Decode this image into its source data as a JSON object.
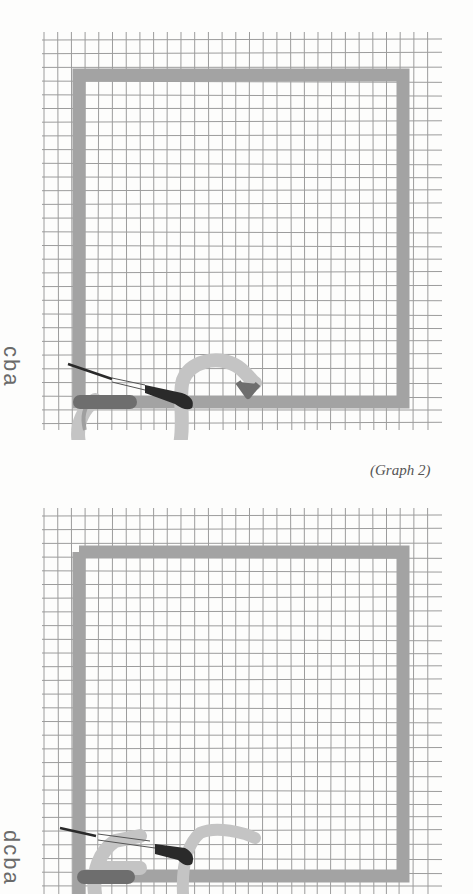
{
  "graphs": [
    {
      "id": "graph-1",
      "side_label": "cba",
      "caption": "(Graph 2)",
      "top": 0,
      "height": 440
    },
    {
      "id": "graph-2",
      "side_label": "dcba",
      "caption": "",
      "top": 476,
      "height": 418
    }
  ],
  "colors": {
    "grid_line": "#8c8c8c",
    "frame_band": "#a3a3a3",
    "stroke_light": "#c4c4c4",
    "stroke_dark": "#6e6e6e",
    "knife": "#2a2a2a",
    "label": "#6a6a6a"
  }
}
